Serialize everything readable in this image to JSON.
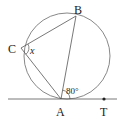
{
  "diagram": {
    "type": "circle-geometry",
    "circle": {
      "cx": 67,
      "cy": 56,
      "r": 43
    },
    "points": {
      "A": {
        "label": "A",
        "x": 61,
        "y": 99
      },
      "B": {
        "label": "B",
        "x": 76,
        "y": 16
      },
      "C": {
        "label": "C",
        "x": 21,
        "y": 48
      },
      "T": {
        "label": "T",
        "x": 104,
        "y": 99
      }
    },
    "segments": [
      "AB",
      "BC",
      "CA"
    ],
    "tangent_line": {
      "through": "A",
      "label_point": "T"
    },
    "angles": {
      "BAT": {
        "label": "80°"
      },
      "BCA": {
        "label": "x"
      }
    },
    "colors": {
      "stroke": "#555555",
      "text": "#222222",
      "background": "#ffffff"
    }
  }
}
